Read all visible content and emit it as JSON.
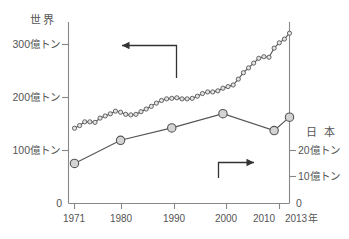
{
  "chart_data": {
    "type": "line",
    "title": "",
    "xlabel": "年",
    "x_tick_labels": [
      "1971",
      "1980",
      "1990",
      "2000",
      "2010",
      "2013"
    ],
    "x_tick_values": [
      1971,
      1980,
      1990,
      2000,
      2010,
      2013
    ],
    "xlim": [
      1971,
      2013
    ],
    "grid": false,
    "legend_position": "none",
    "axes": [
      {
        "id": "left",
        "name": "世界",
        "unit": "億トン",
        "ylim": [
          0,
          340
        ],
        "tick_values": [
          0,
          100,
          200,
          300
        ],
        "tick_labels": [
          "0",
          "100億トン",
          "200億トン",
          "300億トン"
        ]
      },
      {
        "id": "right",
        "name": "日 本",
        "unit": "億トン",
        "ylim": [
          0,
          20.4
        ],
        "tick_values": [
          0,
          10,
          20
        ],
        "tick_labels": [
          "0",
          "10億トン",
          "20億トン"
        ]
      }
    ],
    "series": [
      {
        "name": "世界",
        "axis": "left",
        "unit": "億トン",
        "marker": "small-open-circle",
        "x": [
          1971,
          1972,
          1973,
          1974,
          1975,
          1976,
          1977,
          1978,
          1979,
          1980,
          1981,
          1982,
          1983,
          1984,
          1985,
          1986,
          1987,
          1988,
          1989,
          1990,
          1991,
          1992,
          1993,
          1994,
          1995,
          1996,
          1997,
          1998,
          1999,
          2000,
          2001,
          2002,
          2003,
          2004,
          2005,
          2006,
          2007,
          2008,
          2009,
          2010,
          2011,
          2012,
          2013
        ],
        "values": [
          141,
          146,
          153,
          153,
          152,
          160,
          164,
          168,
          173,
          171,
          167,
          166,
          167,
          172,
          177,
          182,
          188,
          193,
          196,
          197,
          198,
          196,
          196,
          197,
          201,
          206,
          209,
          209,
          211,
          216,
          219,
          222,
          233,
          245,
          254,
          263,
          272,
          275,
          274,
          291,
          301,
          308,
          319
        ]
      },
      {
        "name": "日本",
        "axis": "right",
        "unit": "億トン",
        "marker": "large-filled-circle",
        "x": [
          1971,
          1980,
          1990,
          2000,
          2010,
          2013
        ],
        "values": [
          4.5,
          7.1,
          8.5,
          10.1,
          8.2,
          9.7
        ]
      }
    ],
    "annotations": [
      {
        "name": "world-axis-pointer",
        "direction": "left",
        "description": "elbow arrow pointing left toward the world (left-axis) curve"
      },
      {
        "name": "japan-axis-pointer",
        "direction": "right",
        "description": "elbow arrow pointing right toward the Japan (right-axis) curve"
      }
    ]
  },
  "colors": {
    "line": "#555555",
    "axis": "#888888",
    "text": "#555555",
    "annotation": "#333333",
    "marker_fill": "#d9d9d9",
    "background": "#ffffff"
  }
}
